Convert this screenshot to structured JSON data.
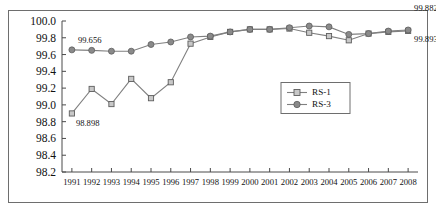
{
  "chart_data": {
    "type": "line",
    "title": "",
    "xlabel": "",
    "ylabel": "",
    "grid": false,
    "legend_position": "center-right",
    "ylim": [
      98.2,
      100.0
    ],
    "ytick_labels": [
      "100.0",
      "99.8",
      "99.6",
      "99.4",
      "99.2",
      "99.0",
      "98.8",
      "98.6",
      "98.4",
      "98.2"
    ],
    "ytick_values": [
      100.0,
      99.8,
      99.6,
      99.4,
      99.2,
      99.0,
      98.8,
      98.6,
      98.4,
      98.2
    ],
    "categories": [
      "1991",
      "1992",
      "1993",
      "1994",
      "1995",
      "1996",
      "1997",
      "1998",
      "1999",
      "2000",
      "2001",
      "2002",
      "2003",
      "2004",
      "2005",
      "2006",
      "2007",
      "2008"
    ],
    "series": [
      {
        "name": "RS-1",
        "marker": "square",
        "color": "#808080",
        "values": [
          98.898,
          99.19,
          99.01,
          99.31,
          99.08,
          99.27,
          99.73,
          99.81,
          99.87,
          99.9,
          99.9,
          99.91,
          99.86,
          99.82,
          99.77,
          99.85,
          99.87,
          99.882
        ]
      },
      {
        "name": "RS-3",
        "marker": "circle",
        "color": "#808080",
        "values": [
          99.656,
          99.65,
          99.64,
          99.64,
          99.72,
          99.75,
          99.81,
          99.82,
          99.87,
          99.9,
          99.9,
          99.92,
          99.94,
          99.93,
          99.84,
          99.85,
          99.88,
          99.893
        ]
      }
    ],
    "annotations": [
      {
        "text": "99.656",
        "series": "RS-3",
        "category": "1991",
        "value": 99.656,
        "position": "above-right"
      },
      {
        "text": "98.898",
        "series": "RS-1",
        "category": "1991",
        "value": 98.898,
        "position": "below-right"
      },
      {
        "text": "99.882",
        "series": "RS-1",
        "category": "2008",
        "value": 99.882,
        "position": "above-left"
      },
      {
        "text": "99.893",
        "series": "RS-3",
        "category": "2008",
        "value": 99.893,
        "position": "below-left"
      }
    ]
  },
  "legend": {
    "entries": [
      {
        "label": "RS-1"
      },
      {
        "label": "RS-3"
      }
    ]
  }
}
